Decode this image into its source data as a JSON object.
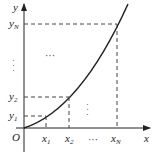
{
  "diagram": {
    "axes": {
      "x_label": "x",
      "y_label": "y",
      "origin_label": "O"
    },
    "x_ticks": [
      {
        "name": "x",
        "sub": "1"
      },
      {
        "name": "x",
        "sub": "2"
      },
      {
        "name": "x",
        "sub": "N"
      }
    ],
    "y_ticks": [
      {
        "name": "y",
        "sub": "1"
      },
      {
        "name": "y",
        "sub": "2"
      },
      {
        "name": "y",
        "sub": "N"
      }
    ],
    "ellipsis_h": "···",
    "ellipsis_v": "⋮",
    "curve": "increasing convex curve from origin",
    "colors": {
      "line": "#222222",
      "dash": "#444444"
    }
  }
}
